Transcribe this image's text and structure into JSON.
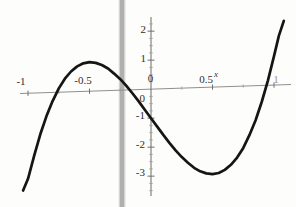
{
  "chart_data": {
    "type": "line",
    "title": "",
    "xlabel": "x",
    "ylabel": "",
    "xlim": [
      -1.07,
      1.14
    ],
    "ylim": [
      -3.7,
      2.5
    ],
    "grid": false,
    "legend": false,
    "x_tick_labels": [
      "-1",
      "-0.5",
      "0",
      "0.5",
      "1"
    ],
    "x_tick_values": [
      -1,
      -0.5,
      0,
      0.5,
      1
    ],
    "y_tick_labels": [
      "2",
      "1",
      "0",
      "-1",
      "-2",
      "-3"
    ],
    "y_tick_values": [
      2,
      1,
      0,
      -1,
      -2,
      -3
    ],
    "minor_tick_step": 0.25,
    "series": [
      {
        "name": "cubic-curve",
        "color": "#151515",
        "points": [
          [
            -1.04,
            -3.35
          ],
          [
            -1.0,
            -2.95
          ],
          [
            -0.95,
            -2.16
          ],
          [
            -0.9,
            -1.43
          ],
          [
            -0.85,
            -0.81
          ],
          [
            -0.8,
            -0.3
          ],
          [
            -0.75,
            0.13
          ],
          [
            -0.7,
            0.46
          ],
          [
            -0.65,
            0.7
          ],
          [
            -0.6,
            0.87
          ],
          [
            -0.55,
            0.97
          ],
          [
            -0.5,
            1.0
          ],
          [
            -0.45,
            0.97
          ],
          [
            -0.4,
            0.89
          ],
          [
            -0.35,
            0.76
          ],
          [
            -0.3,
            0.58
          ],
          [
            -0.25,
            0.38
          ],
          [
            -0.2,
            0.14
          ],
          [
            -0.15,
            -0.13
          ],
          [
            -0.1,
            -0.41
          ],
          [
            -0.05,
            -0.7
          ],
          [
            0,
            -1.0
          ],
          [
            0.05,
            -1.3
          ],
          [
            0.1,
            -1.59
          ],
          [
            0.15,
            -1.87
          ],
          [
            0.2,
            -2.14
          ],
          [
            0.25,
            -2.38
          ],
          [
            0.3,
            -2.58
          ],
          [
            0.35,
            -2.76
          ],
          [
            0.4,
            -2.89
          ],
          [
            0.45,
            -2.97
          ],
          [
            0.5,
            -3.0
          ],
          [
            0.55,
            -2.97
          ],
          [
            0.6,
            -2.87
          ],
          [
            0.65,
            -2.7
          ],
          [
            0.7,
            -2.46
          ],
          [
            0.75,
            -2.13
          ],
          [
            0.8,
            -1.7
          ],
          [
            0.85,
            -1.19
          ],
          [
            0.9,
            -0.57
          ],
          [
            0.95,
            0.16
          ],
          [
            1.0,
            1.0
          ],
          [
            1.04,
            1.7
          ],
          [
            1.08,
            2.2
          ]
        ]
      }
    ],
    "key_points": {
      "x_intercepts": [
        -0.8,
        -0.19,
        0.94
      ],
      "y_intercept": [
        0,
        -1.0
      ],
      "local_max": [
        -0.5,
        1.0
      ],
      "local_min": [
        0.5,
        -3.0
      ]
    },
    "annotations": {
      "vertical_gray_line_x": -0.24
    }
  },
  "decor": {
    "gray_line_color": "#b0b0b0",
    "axis_color": "#7d7d7d",
    "tick_color": "#6f6f6f",
    "minor_tick_color": "#9b9b9b"
  }
}
